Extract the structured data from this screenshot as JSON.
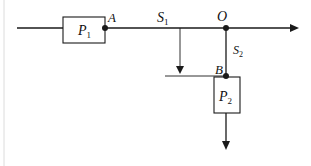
{
  "diagram": {
    "labels": {
      "P1": {
        "main": "P",
        "sub": "1"
      },
      "P2": {
        "main": "P",
        "sub": "2"
      },
      "A": "A",
      "O": "O",
      "B": "B",
      "S1": {
        "main": "S",
        "sub": "1"
      },
      "S2": {
        "main": "S",
        "sub": "2"
      }
    },
    "colors": {
      "stroke": "#1a1a1a",
      "border": "#d9d9d9"
    }
  }
}
